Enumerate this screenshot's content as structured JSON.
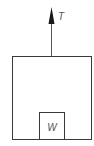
{
  "diagram": {
    "type": "free-body-diagram",
    "force_label": "T",
    "weight_label": "W",
    "colors": {
      "stroke": "#3a3a3a",
      "arrow": "#1a1a1a",
      "text": "#555555",
      "background": "#ffffff"
    }
  }
}
